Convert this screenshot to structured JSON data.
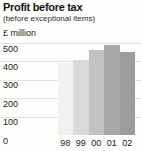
{
  "chart": {
    "title": "Profit before tax",
    "subtitle": "(before exceptional items)",
    "units_label": "£ million"
  },
  "chart_data": {
    "type": "bar",
    "title": "Profit before tax",
    "subtitle": "(before exceptional items)",
    "ylabel": "£ million",
    "xlabel": "",
    "categories": [
      "98",
      "99",
      "00",
      "01",
      "02"
    ],
    "values": [
      390,
      405,
      460,
      490,
      450
    ],
    "ylim": [
      0,
      500
    ],
    "yticks": [
      0,
      100,
      200,
      300,
      400,
      500
    ],
    "grid": true,
    "legend": "none",
    "bar_colors": [
      "#f1f1ef",
      "#d9d9d7",
      "#c2c2c0",
      "#a8a8a6",
      "#9c9c9a"
    ]
  }
}
